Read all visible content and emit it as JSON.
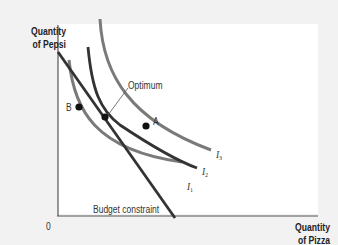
{
  "diagram": {
    "y_axis_label_line1": "Quantity",
    "y_axis_label_line2": "of Pepsi",
    "x_axis_label_line1": "Quantity",
    "x_axis_label_line2": "of Pizza",
    "origin_label": "0",
    "optimum_label": "Optimum",
    "point_a_label": "A",
    "point_b_label": "B",
    "budget_label": "Budget constraint",
    "curves": [
      {
        "name": "I",
        "sub": "1",
        "color": "#7a7a7a"
      },
      {
        "name": "I",
        "sub": "2",
        "color": "#333333"
      },
      {
        "name": "I",
        "sub": "3",
        "color": "#7a7a7a"
      }
    ],
    "budget_line_color": "#333333"
  }
}
